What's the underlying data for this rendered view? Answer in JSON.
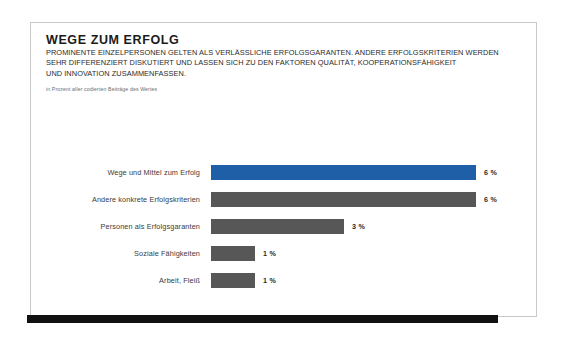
{
  "slide": {
    "title": "WEGE ZUM ERFOLG",
    "subtitle_lines": [
      "PROMINENTE EINZELPERSONEN GELTEN ALS VERLÄSSLICHE ERFOLGSGARANTEN. ANDERE ERFOLGSKRITERIEN WERDEN",
      "SEHR DIFFERENZIERT DISKUTIERT UND LASSEN SICH ZU DEN FAKTOREN QUALITÄT, KOOPERATIONSFÄHIGKEIT",
      "UND INNOVATION ZUSAMMENFASSEN."
    ],
    "note": "in Prozent aller codierten Beiträge des Wertes"
  },
  "colors": {
    "highlight_bar": "#1f5fa8",
    "default_bar": "#575757",
    "card_border": "#c9c9c9",
    "band": "#111111",
    "page_background": "#ffffff"
  },
  "chart_data": {
    "type": "bar",
    "orientation": "horizontal",
    "title": "WEGE ZUM ERFOLG",
    "subtitle": "PROMINENTE EINZELPERSONEN GELTEN ALS VERLÄSSLICHE ERFOLGSGARANTEN. ANDERE ERFOLGSKRITERIEN WERDEN SEHR DIFFERENZIERT DISKUTIERT UND LASSEN SICH ZU DEN FAKTOREN QUALITÄT, KOOPERATIONSFÄHIGKEIT UND INNOVATION ZUSAMMENFASSEN.",
    "note": "in Prozent aller codierten Beiträge des Wertes",
    "xlabel": "",
    "ylabel": "",
    "unit": "%",
    "xlim": [
      0,
      6
    ],
    "grid": false,
    "legend": "none",
    "categories": [
      "Wege und Mittel zum Erfolg",
      "Andere konkrete Erfolgskriterien",
      "Personen als Erfolgsgaranten",
      "Soziale Fähigkeiten",
      "Arbeit, Fleiß"
    ],
    "values": [
      6,
      6,
      3,
      1,
      1
    ],
    "value_labels": [
      "6 %",
      "6 %",
      "3 %",
      "1 %",
      "1 %"
    ],
    "bar_colors": [
      "#1f5fa8",
      "#575757",
      "#575757",
      "#575757",
      "#575757"
    ]
  }
}
